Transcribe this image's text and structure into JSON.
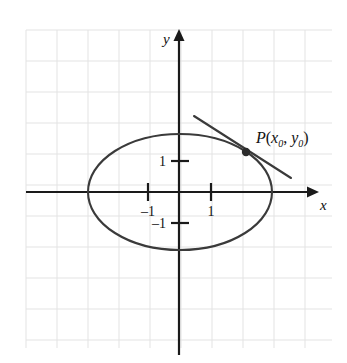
{
  "figure": {
    "background_color": "#ffffff",
    "grid": {
      "color": "#e3e3e3",
      "spacing_px": 31,
      "left": 26,
      "top": 30,
      "right": 332,
      "bottom": 348,
      "columns": 10,
      "rows": 10,
      "visible": true
    },
    "axes": {
      "color": "#1a1a1a",
      "origin_x": 180,
      "origin_y": 192,
      "unit_px": 31,
      "x_label": "x",
      "y_label": "y",
      "x_axis_start": 26,
      "x_axis_end": 315,
      "y_axis_start": 33,
      "y_axis_end": 355
    },
    "ticks": {
      "x": [
        {
          "label": "–1",
          "value": -1,
          "px": 148
        },
        {
          "label": "1",
          "value": 1,
          "px": 211
        }
      ],
      "y": [
        {
          "label": "1",
          "value": 1,
          "px": 161
        },
        {
          "label": "–1",
          "value": -1,
          "px": 223
        }
      ]
    },
    "curve": {
      "name": "ellipse",
      "color": "#3a3a3a",
      "stroke_width": 2.1,
      "center_x": 180,
      "center_y": 192,
      "semi_axis_x_px": 92,
      "semi_axis_y_px": 58,
      "semi_axis_x_units": 3.0,
      "semi_axis_y_units": 1.9
    },
    "tangent": {
      "name": "tangent-line",
      "color": "#3a3a3a",
      "stroke_width": 2.1,
      "x1": 194,
      "y1": 116,
      "x2": 291,
      "y2": 178
    },
    "point": {
      "name": "P",
      "label_p": "P",
      "label_open": "(",
      "label_x_var": "x",
      "label_x_sub": "0",
      "label_comma": ", ",
      "label_y_var": "y",
      "label_y_sub": "0",
      "label_close": ")",
      "label_full": "P(x0, y0)",
      "cx": 246,
      "cy": 152,
      "radius": 4.2,
      "color": "#2b2b2b"
    }
  },
  "chart_data": {
    "type": "line",
    "xlabel": "x",
    "ylabel": "y",
    "xlim": [
      -4.97,
      4.35
    ],
    "ylim": [
      -5.26,
      5.13
    ],
    "grid": true,
    "legend": null,
    "series": [
      {
        "name": "ellipse",
        "kind": "ellipse",
        "center": [
          0,
          0
        ],
        "semi_axis_x": 3.0,
        "semi_axis_y": 1.9
      },
      {
        "name": "tangent-line",
        "kind": "segment",
        "x": [
          -0.45,
          3.58
        ],
        "y": [
          2.45,
          0.45
        ]
      }
    ],
    "points": [
      {
        "label": "P(x₀, y₀)",
        "x": 2.13,
        "y": 1.29
      }
    ],
    "xticks": [
      -1,
      1
    ],
    "xticklabels": [
      "–1",
      "1"
    ],
    "yticks": [
      -1,
      1
    ],
    "yticklabels": [
      "–1",
      "1"
    ],
    "annotations": [
      "P(x₀, y₀)"
    ]
  }
}
